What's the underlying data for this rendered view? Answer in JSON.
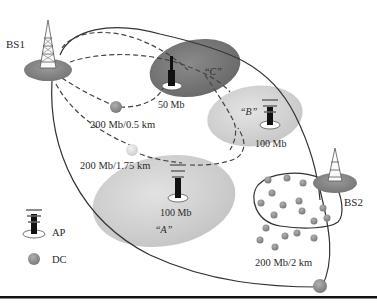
{
  "diagram": {
    "base_stations": [
      {
        "id": "bs1",
        "label": "BS1"
      },
      {
        "id": "bs2",
        "label": "BS2"
      }
    ],
    "zones": [
      {
        "id": "zone-c",
        "label": "“C”",
        "capacity": "50 Mb",
        "color": "#7d7d7d"
      },
      {
        "id": "zone-b",
        "label": "“B”",
        "capacity": "100 Mb",
        "color": "#d4d4d4"
      },
      {
        "id": "zone-a",
        "label": "“A”",
        "capacity": "100 Mb",
        "color": "#d2d2d2"
      }
    ],
    "links": [
      {
        "id": "link-1",
        "label": "200 Mb/0.5 km"
      },
      {
        "id": "link-2",
        "label": "200 Mb/1.75 km"
      },
      {
        "id": "link-3",
        "label": "200 Mb/2 km"
      }
    ],
    "legend": {
      "items": [
        {
          "icon": "access-point-icon",
          "label": "AP"
        },
        {
          "icon": "data-collector-icon",
          "label": "DC"
        }
      ]
    },
    "colors": {
      "dc_dot": "#8c8c8c",
      "bs_base": "#8a8a8a",
      "line": "#333333",
      "rule": "#111111"
    }
  }
}
